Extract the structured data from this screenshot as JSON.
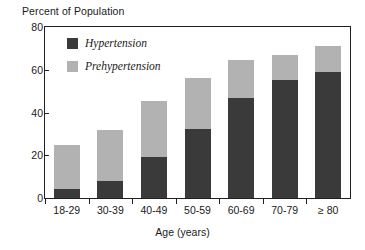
{
  "chart_data": {
    "type": "bar",
    "subtype": "stacked-vertical",
    "title": "",
    "xlabel": "Age (years)",
    "ylabel": "Percent of Population",
    "ylim": [
      0,
      80
    ],
    "yticks": [
      0,
      20,
      40,
      60,
      80
    ],
    "grid": false,
    "legend_position": "inside-top-left",
    "categories": [
      "18-29",
      "30-39",
      "40-49",
      "50-59",
      "60-69",
      "70-79",
      "≥ 80"
    ],
    "series": [
      {
        "name": "Hypertension",
        "color": "#3a3a3a",
        "values": [
          4,
          8,
          19,
          32.5,
          47,
          55,
          59
        ]
      },
      {
        "name": "Prehypertension",
        "color": "#b2b2b2",
        "values": [
          21,
          24,
          26.5,
          23.5,
          17.5,
          12,
          12
        ]
      }
    ],
    "totals": [
      25,
      32,
      45.5,
      56,
      64.5,
      67,
      71
    ]
  },
  "axes": {
    "y_title": "Percent of Population",
    "x_title": "Age (years)",
    "y_tick_labels": [
      "80",
      "60",
      "40",
      "20",
      "0"
    ],
    "x_tick_labels": [
      "18-29",
      "30-39",
      "40-49",
      "50-59",
      "60-69",
      "70-79",
      "≥ 80"
    ]
  },
  "legend": {
    "items": [
      {
        "label": "Hypertension",
        "color": "#3a3a3a"
      },
      {
        "label": "Prehypertension",
        "color": "#b2b2b2"
      }
    ]
  },
  "colors": {
    "hypertension": "#3a3a3a",
    "prehypertension": "#b2b2b2",
    "axis": "#231f20",
    "text": "#1a1a1a",
    "background": "#ffffff"
  }
}
